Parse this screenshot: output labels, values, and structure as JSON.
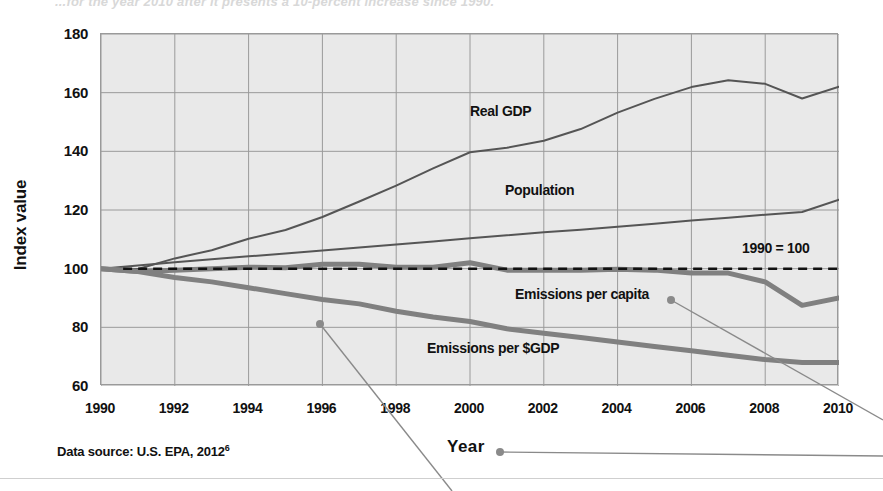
{
  "figure": {
    "cropped_title": "...for the year 2010 after it presents a 10-percent increase since 1990.",
    "y_axis_title": "Index value",
    "x_axis_title": "Year",
    "data_source": "Data source: U.S. EPA, 2012",
    "data_source_superscript": "6",
    "baseline_note": "1990 = 100"
  },
  "callouts": [
    {
      "name": "year-callout",
      "label": "Year",
      "dot_x": 500,
      "dot_y": 452
    },
    {
      "name": "emissions-per-capita-callout",
      "label": "Emissions per capita",
      "dot_x": 671,
      "dot_y": 300
    },
    {
      "name": "emissions-per-gdp-callout",
      "label": "Emissions per $GDP",
      "dot_x": 320,
      "dot_y": 324
    }
  ],
  "chart_data": {
    "type": "line",
    "title": "",
    "xlabel": "Year",
    "ylabel": "Index value",
    "xlim": [
      1990,
      2010
    ],
    "ylim": [
      60,
      180
    ],
    "yticks": [
      60,
      80,
      100,
      120,
      140,
      160,
      180
    ],
    "xticks": [
      1990,
      1992,
      1994,
      1996,
      1998,
      2000,
      2002,
      2004,
      2006,
      2008,
      2010
    ],
    "grid": true,
    "legend": "inline-labels",
    "baseline": {
      "label": "1990 = 100",
      "value": 100,
      "style": "dashed"
    },
    "x": [
      1990,
      1991,
      1992,
      1993,
      1994,
      1995,
      1996,
      1997,
      1998,
      1999,
      2000,
      2001,
      2002,
      2003,
      2004,
      2005,
      2006,
      2007,
      2008,
      2009,
      2010
    ],
    "series": [
      {
        "name": "Real GDP",
        "color": "#555555",
        "width": 2,
        "values": [
          100,
          99.9,
          103.5,
          106.3,
          110.2,
          113.2,
          117.6,
          122.9,
          128.3,
          134.2,
          139.7,
          141.2,
          143.6,
          147.6,
          153.2,
          157.9,
          161.9,
          164.2,
          163.0,
          158.0,
          162.0
        ]
      },
      {
        "name": "Population",
        "color": "#555555",
        "width": 2,
        "values": [
          100,
          101.1,
          102.2,
          103.2,
          104.2,
          105.2,
          106.2,
          107.2,
          108.2,
          109.3,
          110.4,
          111.4,
          112.4,
          113.3,
          114.3,
          115.3,
          116.4,
          117.4,
          118.4,
          119.3,
          123.5
        ]
      },
      {
        "name": "Emissions per capita",
        "color": "#808080",
        "width": 5,
        "values": [
          100,
          99.0,
          99.5,
          100.0,
          100.5,
          100.3,
          101.5,
          101.5,
          100.5,
          100.5,
          102.0,
          99.5,
          99.5,
          99.5,
          99.8,
          99.5,
          98.5,
          98.5,
          95.5,
          87.5,
          90.0
        ]
      },
      {
        "name": "Emissions per $GDP",
        "color": "#808080",
        "width": 5,
        "values": [
          100,
          99.0,
          97.0,
          95.5,
          93.5,
          91.5,
          89.5,
          88.0,
          85.5,
          83.5,
          82.0,
          79.5,
          78.0,
          76.5,
          75.0,
          73.5,
          72.0,
          70.5,
          69.0,
          68.0,
          68.0
        ]
      }
    ]
  }
}
